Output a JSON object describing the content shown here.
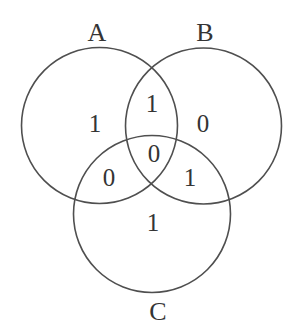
{
  "diagram": {
    "type": "venn-3-set",
    "colors": {
      "stroke": "#4f4f4f",
      "text": "#343434",
      "background": "#ffffff"
    },
    "sets": [
      {
        "label": "A"
      },
      {
        "label": "B"
      },
      {
        "label": "C"
      }
    ],
    "regions": {
      "a_only": "1",
      "b_only": "0",
      "c_only": "1",
      "a_and_b": "1",
      "a_and_c": "0",
      "b_and_c": "1",
      "a_and_b_and_c": "0"
    }
  }
}
